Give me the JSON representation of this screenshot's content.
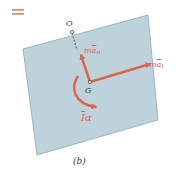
{
  "diagram": {
    "equals_sign": "=",
    "panel_label": "(b)",
    "points": {
      "pivot": "O",
      "center_of_mass": "G"
    },
    "vectors": {
      "normal": {
        "symbol": "m",
        "accel": "a",
        "subscript": "n",
        "full": "ma̅n"
      },
      "tangential": {
        "symbol": "m",
        "accel": "a",
        "subscript": "t",
        "full": "ma̅t"
      },
      "moment": {
        "inertia": "I",
        "alpha": "α",
        "full": "I̅α"
      }
    },
    "colors": {
      "body_fill": "#b9cfd8",
      "body_edge": "#8fa9b4",
      "vector": "#e0624a",
      "text": "#3a3a3a"
    }
  }
}
